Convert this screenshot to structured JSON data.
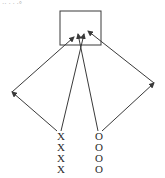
{
  "header_fragment": "·· · · ·°",
  "diagram": {
    "target_box": {
      "label": ""
    },
    "left_column": {
      "symbol": "X",
      "count": 4
    },
    "right_column": {
      "symbol": "O",
      "count": 4
    },
    "arrows": [
      {
        "name": "x-to-left-apex",
        "from": "X column",
        "to": "left apex"
      },
      {
        "name": "left-apex-to-box",
        "from": "left apex",
        "to": "box"
      },
      {
        "name": "x-to-box",
        "from": "X column",
        "to": "box"
      },
      {
        "name": "o-to-box",
        "from": "O column",
        "to": "box"
      },
      {
        "name": "o-to-right-apex",
        "from": "O column",
        "to": "right apex"
      },
      {
        "name": "right-apex-to-box",
        "from": "right apex",
        "to": "box"
      }
    ],
    "colors": {
      "line": "#3a3a3a",
      "text": "#2a2a2a"
    }
  }
}
